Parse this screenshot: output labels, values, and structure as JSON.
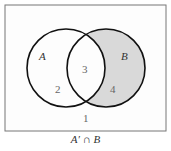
{
  "diagram": {
    "type": "venn",
    "sets": [
      {
        "label": "A"
      },
      {
        "label": "B"
      }
    ],
    "regions": [
      {
        "number": "1",
        "description": "outside A and B"
      },
      {
        "number": "2",
        "description": "A only"
      },
      {
        "number": "3",
        "description": "A and B"
      },
      {
        "number": "4",
        "description": "B only",
        "shaded": true
      }
    ],
    "shade_color": "#d9d9d9",
    "caption": "A′ ∩ B"
  }
}
